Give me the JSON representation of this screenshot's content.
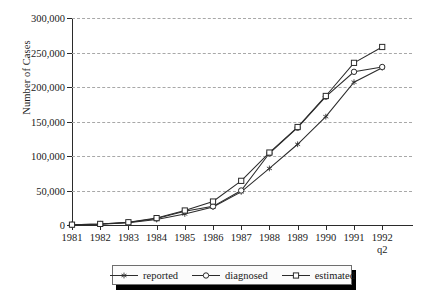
{
  "chart_data": {
    "type": "line",
    "title": "",
    "xlabel": "",
    "ylabel": "Number of Cases",
    "ylim": [
      0,
      300000
    ],
    "ytick_labels": [
      "0",
      "50,000",
      "100,000",
      "150,000",
      "200,000",
      "250,000",
      "300,000"
    ],
    "ytick_values": [
      0,
      50000,
      100000,
      150000,
      200000,
      250000,
      300000
    ],
    "grid": "horizontal-dashed",
    "legend_position": "bottom-center",
    "categories": [
      "1981",
      "1982",
      "1983",
      "1984",
      "1985",
      "1986",
      "1987",
      "1988",
      "1989",
      "1990",
      "1991",
      "1992 q2"
    ],
    "x_tick_labels": [
      {
        "line1": "1981",
        "line2": ""
      },
      {
        "line1": "1982",
        "line2": ""
      },
      {
        "line1": "1983",
        "line2": ""
      },
      {
        "line1": "1984",
        "line2": ""
      },
      {
        "line1": "1985",
        "line2": ""
      },
      {
        "line1": "1986",
        "line2": ""
      },
      {
        "line1": "1987",
        "line2": ""
      },
      {
        "line1": "1988",
        "line2": ""
      },
      {
        "line1": "1989",
        "line2": ""
      },
      {
        "line1": "1990",
        "line2": ""
      },
      {
        "line1": "1991",
        "line2": ""
      },
      {
        "line1": "1992",
        "line2": "q2"
      }
    ],
    "series": [
      {
        "name": "reported",
        "marker": "star",
        "values": [
          300,
          1200,
          3200,
          8000,
          16000,
          26000,
          48000,
          82000,
          117000,
          157000,
          207000,
          228000
        ]
      },
      {
        "name": "diagnosed",
        "marker": "circle",
        "values": [
          400,
          1400,
          3600,
          9500,
          20000,
          27000,
          50000,
          104000,
          141000,
          186000,
          222000,
          229000
        ]
      },
      {
        "name": "estimated",
        "marker": "square",
        "values": [
          500,
          1600,
          4000,
          10000,
          21000,
          34000,
          64000,
          105000,
          142000,
          187000,
          235000,
          258000
        ]
      }
    ]
  },
  "legend": {
    "items": [
      {
        "label": "reported",
        "marker": "star-marker"
      },
      {
        "label": "diagnosed",
        "marker": "circle-marker"
      },
      {
        "label": "estimated",
        "marker": "square-marker"
      }
    ]
  },
  "colors": {
    "ink": "#2b2b2b",
    "grid": "#a8a8a8",
    "legend_shadow": "#000000",
    "background": "#ffffff"
  }
}
